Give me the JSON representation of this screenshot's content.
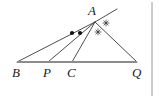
{
  "figure": {
    "kind": "euclidean-geometry-diagram",
    "canvas": {
      "width": 161,
      "height": 98
    },
    "colors": {
      "ink": "#1a1a1a",
      "line": "#3a3a3a",
      "baseline": "#8c8c8c",
      "border": "#9a9a9a",
      "background": "#ffffff",
      "marker_dot": "#111111",
      "marker_star": "#2b2b2b"
    },
    "points": [
      {
        "name": "A",
        "label": "A",
        "x": 95,
        "y": 22,
        "label_x": 88,
        "label_y": 4
      },
      {
        "name": "B",
        "label": "B",
        "x": 17,
        "y": 62,
        "label_x": 12,
        "label_y": 66
      },
      {
        "name": "P",
        "label": "P",
        "x": 48,
        "y": 62,
        "label_x": 43,
        "label_y": 66
      },
      {
        "name": "C",
        "label": "C",
        "x": 72,
        "y": 62,
        "label_x": 67,
        "label_y": 66
      },
      {
        "name": "Q",
        "label": "Q",
        "x": 137,
        "y": 62,
        "label_x": 132,
        "label_y": 66
      }
    ],
    "baseline": {
      "from": "B",
      "to": "Q",
      "x1": 17,
      "y1": 62,
      "x2": 137,
      "y2": 62
    },
    "segments": [
      {
        "name": "AB",
        "x1": 95,
        "y1": 22,
        "x2": 17,
        "y2": 62
      },
      {
        "name": "AP",
        "x1": 95,
        "y1": 22,
        "x2": 48,
        "y2": 62
      },
      {
        "name": "AC",
        "x1": 95,
        "y1": 22,
        "x2": 72,
        "y2": 62
      },
      {
        "name": "AQ",
        "x1": 95,
        "y1": 22,
        "x2": 137,
        "y2": 62
      }
    ],
    "external_line": {
      "name": "tangent-through-A",
      "x1": 95,
      "y1": 22,
      "x2": 117,
      "y2": 9
    },
    "angle_markers": [
      {
        "name": "angle-dot-BAP",
        "style": "dot",
        "x": 72,
        "y": 33,
        "r": 2.1
      },
      {
        "name": "angle-dot-PAC",
        "style": "dot",
        "x": 80,
        "y": 33,
        "r": 2.1
      },
      {
        "name": "angle-star-CAQ",
        "style": "star",
        "x": 98,
        "y": 32,
        "size": 3.4
      },
      {
        "name": "angle-star-QAX",
        "style": "star",
        "x": 106,
        "y": 23,
        "size": 3.4
      }
    ],
    "border": {
      "name": "right-frame-rule",
      "x": 152,
      "y1": 2,
      "y2": 96
    }
  }
}
